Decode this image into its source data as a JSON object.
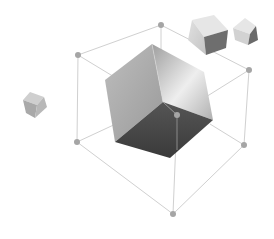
{
  "illustration": {
    "subject": "3D cube inside wireframe cube with floating small cubes",
    "colors": {
      "background": "#ffffff",
      "wire": "#cfcfcf",
      "node": "#a8a8a8",
      "cube_light": "#d9d9d9",
      "cube_mid": "#b3b3b3",
      "cube_dark": "#4a4a4a"
    }
  }
}
